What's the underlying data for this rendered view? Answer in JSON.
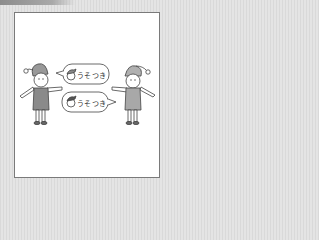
{
  "illustration": {
    "description": "Two elves pointing at each other with speech bubbles",
    "bubble_top": {
      "text": "うそつき",
      "icon": "elf-head-icon"
    },
    "bubble_bottom": {
      "text": "うそつき",
      "icon": "elf-head-icon"
    },
    "colors": {
      "frame_border": "#7a7a7a",
      "left_vest": "#8a8a8a",
      "right_vest": "#a8a8a8",
      "hat_left": "#999999",
      "hat_right": "#b0b0b0",
      "outline": "#444444"
    }
  }
}
